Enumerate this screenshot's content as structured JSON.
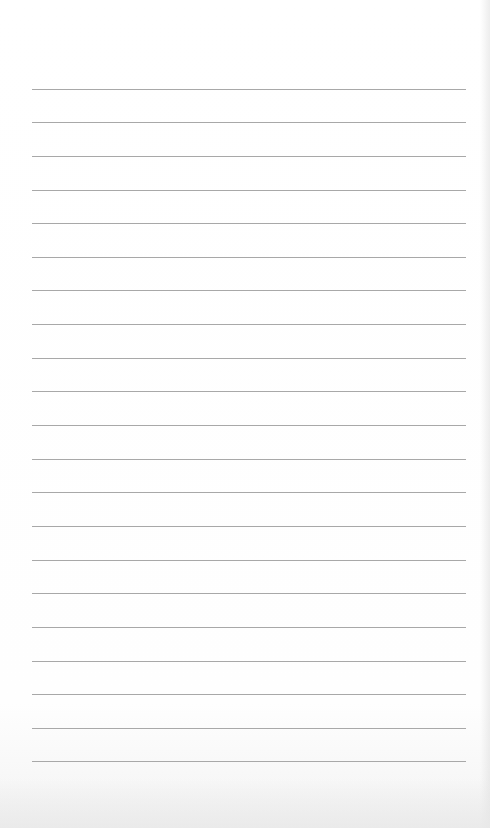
{
  "page": {
    "type": "lined-paper",
    "line_color": "#a8a8a8",
    "background": "#ffffff",
    "line_count": 21,
    "line_left": 32,
    "line_width": 434,
    "line_positions": [
      89,
      122,
      156,
      190,
      223,
      257,
      290,
      324,
      358,
      391,
      425,
      459,
      492,
      526,
      560,
      593,
      627,
      661,
      694,
      728,
      761
    ]
  }
}
